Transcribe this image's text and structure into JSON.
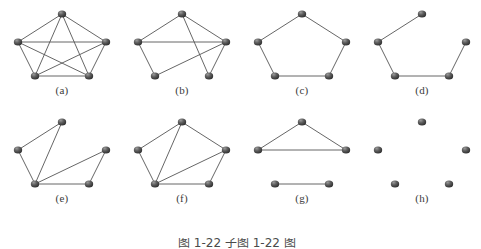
{
  "figure": {
    "caption": "图 1-22 子图 1-22 图",
    "vertex_color": "#4a4a4a",
    "edge_color": "#555555",
    "background_color": "#ffffff",
    "label_color": "#3a3a3a"
  },
  "layout": {
    "columns": 4,
    "rows": 2,
    "cell_width": 120,
    "cell_height": 108
  },
  "vertices": {
    "names": [
      "top",
      "left",
      "right",
      "bottom-left",
      "bottom-right"
    ],
    "positions": [
      {
        "id": "top",
        "x": 60,
        "y": 12
      },
      {
        "id": "left",
        "x": 16,
        "y": 40
      },
      {
        "id": "right",
        "x": 104,
        "y": 40
      },
      {
        "id": "bottom-left",
        "x": 33,
        "y": 74
      },
      {
        "id": "bottom-right",
        "x": 87,
        "y": 74
      }
    ]
  },
  "graphs": [
    {
      "id": "a",
      "label": "(a)",
      "name": "complete-graph-k5",
      "edge_count": 10,
      "vertex_count": 5,
      "edges": [
        [
          "top",
          "left"
        ],
        [
          "top",
          "right"
        ],
        [
          "top",
          "bottom-left"
        ],
        [
          "top",
          "bottom-right"
        ],
        [
          "left",
          "right"
        ],
        [
          "left",
          "bottom-left"
        ],
        [
          "left",
          "bottom-right"
        ],
        [
          "right",
          "bottom-left"
        ],
        [
          "right",
          "bottom-right"
        ],
        [
          "bottom-left",
          "bottom-right"
        ]
      ]
    },
    {
      "id": "b",
      "label": "(b)",
      "name": "graph-b",
      "edge_count": 7,
      "vertex_count": 5,
      "edges": [
        [
          "top",
          "left"
        ],
        [
          "top",
          "right"
        ],
        [
          "top",
          "bottom-right"
        ],
        [
          "left",
          "right"
        ],
        [
          "left",
          "bottom-left"
        ],
        [
          "right",
          "bottom-left"
        ],
        [
          "right",
          "bottom-right"
        ]
      ]
    },
    {
      "id": "c",
      "label": "(c)",
      "name": "cycle-c5",
      "edge_count": 5,
      "vertex_count": 5,
      "edges": [
        [
          "top",
          "left"
        ],
        [
          "top",
          "right"
        ],
        [
          "left",
          "bottom-left"
        ],
        [
          "right",
          "bottom-right"
        ],
        [
          "bottom-left",
          "bottom-right"
        ]
      ]
    },
    {
      "id": "d",
      "label": "(d)",
      "name": "path-p5",
      "edge_count": 4,
      "vertex_count": 5,
      "edges": [
        [
          "top",
          "left"
        ],
        [
          "left",
          "bottom-left"
        ],
        [
          "bottom-left",
          "bottom-right"
        ],
        [
          "bottom-right",
          "right"
        ]
      ]
    },
    {
      "id": "e",
      "label": "(e)",
      "name": "graph-e",
      "edge_count": 6,
      "vertex_count": 5,
      "edges": [
        [
          "top",
          "left"
        ],
        [
          "top",
          "bottom-left"
        ],
        [
          "left",
          "bottom-left"
        ],
        [
          "bottom-left",
          "right"
        ],
        [
          "bottom-left",
          "bottom-right"
        ],
        [
          "right",
          "bottom-right"
        ]
      ]
    },
    {
      "id": "f",
      "label": "(f)",
      "name": "graph-f",
      "edge_count": 7,
      "vertex_count": 5,
      "edges": [
        [
          "top",
          "left"
        ],
        [
          "top",
          "right"
        ],
        [
          "top",
          "bottom-left"
        ],
        [
          "left",
          "bottom-left"
        ],
        [
          "right",
          "bottom-left"
        ],
        [
          "right",
          "bottom-right"
        ],
        [
          "bottom-left",
          "bottom-right"
        ]
      ]
    },
    {
      "id": "g",
      "label": "(g)",
      "name": "graph-g-triangle-plus-edge",
      "edge_count": 4,
      "vertex_count": 5,
      "edges": [
        [
          "top",
          "left"
        ],
        [
          "top",
          "right"
        ],
        [
          "left",
          "right"
        ],
        [
          "bottom-left",
          "bottom-right"
        ]
      ]
    },
    {
      "id": "h",
      "label": "(h)",
      "name": "empty-graph",
      "edge_count": 0,
      "vertex_count": 5,
      "edges": []
    }
  ]
}
